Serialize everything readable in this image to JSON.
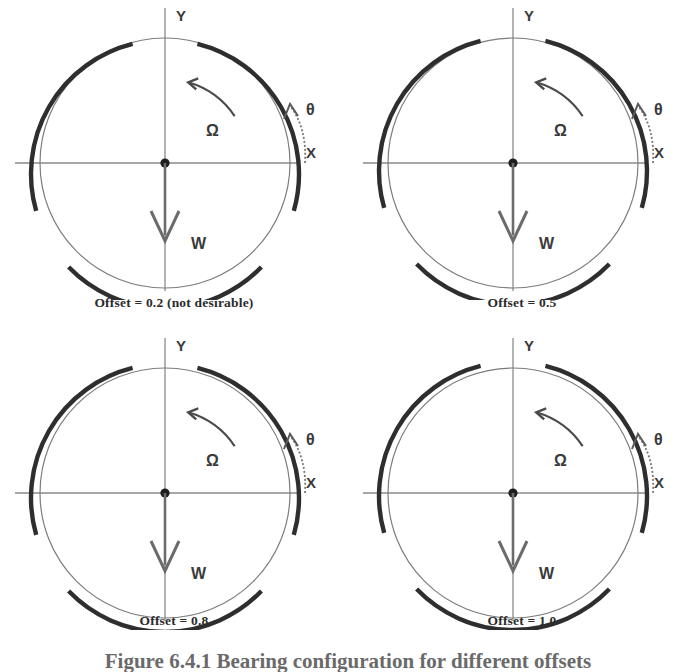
{
  "figure": {
    "caption": "Figure 6.4.1 Bearing configuration for different offsets"
  },
  "labels": {
    "x_axis": "X",
    "y_axis": "Y",
    "load": "W",
    "rotation": "Ω",
    "angle": "θ"
  },
  "colors": {
    "pad": "#2e2e2e",
    "journal": "#7d7d7d",
    "axis": "#8a8a8a",
    "text": "#3a3a3a",
    "caption": "#2b2b2b",
    "figure_caption": "#6a6a6a"
  },
  "chart_data": {
    "type": "diagram",
    "title": "Figure 6.4.1 Bearing configuration for different offsets",
    "panel_count": 4,
    "grid": [
      2,
      2
    ],
    "journal_radius_px": 125,
    "pad_radius_px": 134,
    "pad_count_per_panel": 3,
    "common_annotations": [
      "X",
      "Y",
      "W",
      "Ω",
      "θ"
    ],
    "load_direction": "downward (negative Y)",
    "rotation_direction": "counterclockwise",
    "panels": [
      {
        "offset": 0.2,
        "caption": "Offset = 0.2 (not desirable)",
        "desirable": false,
        "pad_eccentricity_px": 11,
        "pads": [
          {
            "name": "upper-left-pad",
            "start_deg": 104,
            "end_deg": 196
          },
          {
            "name": "right-pad",
            "start_deg": -16,
            "end_deg": 76
          },
          {
            "name": "bottom-pad",
            "start_deg": 224,
            "end_deg": 316
          }
        ]
      },
      {
        "offset": 0.5,
        "caption": "Offset = 0.5",
        "desirable": true,
        "pad_eccentricity_px": 8,
        "pads": [
          {
            "name": "upper-left-pad",
            "start_deg": 104,
            "end_deg": 196
          },
          {
            "name": "right-pad",
            "start_deg": -16,
            "end_deg": 76
          },
          {
            "name": "bottom-pad",
            "start_deg": 224,
            "end_deg": 316
          }
        ]
      },
      {
        "offset": 0.8,
        "caption": "Offset = 0.8",
        "desirable": true,
        "pad_eccentricity_px": 5,
        "pads": [
          {
            "name": "upper-left-pad",
            "start_deg": 104,
            "end_deg": 196
          },
          {
            "name": "right-pad",
            "start_deg": -16,
            "end_deg": 76
          },
          {
            "name": "bottom-pad",
            "start_deg": 224,
            "end_deg": 316
          }
        ]
      },
      {
        "offset": 1.0,
        "caption": "Offset = 1.0",
        "desirable": true,
        "pad_eccentricity_px": 3,
        "pads": [
          {
            "name": "upper-left-pad",
            "start_deg": 104,
            "end_deg": 196
          },
          {
            "name": "right-pad",
            "start_deg": -16,
            "end_deg": 76
          },
          {
            "name": "bottom-pad",
            "start_deg": 224,
            "end_deg": 316
          }
        ]
      }
    ]
  }
}
